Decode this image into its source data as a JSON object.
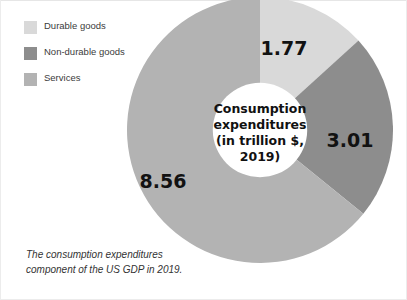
{
  "legend": {
    "items": [
      {
        "label": "Durable goods",
        "color": "#d9d9d9"
      },
      {
        "label": "Non-durable goods",
        "color": "#8d8d8d"
      },
      {
        "label": "Services",
        "color": "#b3b3b3"
      }
    ]
  },
  "center": {
    "line1": "Consumption",
    "line2": "expenditures",
    "line3": "(in trillion $,",
    "line4": "2019)"
  },
  "labels": {
    "durable": "1.77",
    "nondurable": "3.01",
    "services": "8.56"
  },
  "caption": {
    "line1": "The consumption expenditures",
    "line2": "component of the US GDP in 2019."
  },
  "chart_data": {
    "type": "pie",
    "variant": "donut",
    "title": "Consumption expenditures (in trillion $, 2019)",
    "unit": "trillion $",
    "year": "2019",
    "total": 13.34,
    "categories": [
      "Durable goods",
      "Non-durable goods",
      "Services"
    ],
    "values": [
      1.77,
      3.01,
      8.56
    ],
    "value_labels": [
      "1.77",
      "3.01",
      "8.56"
    ],
    "colors": [
      "#d9d9d9",
      "#8d8d8d",
      "#b3b3b3"
    ],
    "percentages": [
      13.3,
      22.6,
      64.2
    ],
    "start_angle_deg": 0,
    "direction": "clockwise",
    "inner_radius_ratio": 0.355,
    "legend": {
      "position": "top-left",
      "entries": [
        "Durable goods",
        "Non-durable goods",
        "Services"
      ]
    },
    "grid": false,
    "xlabel": "",
    "ylabel": "",
    "annotation": "The consumption expenditures component of the US GDP in 2019."
  }
}
